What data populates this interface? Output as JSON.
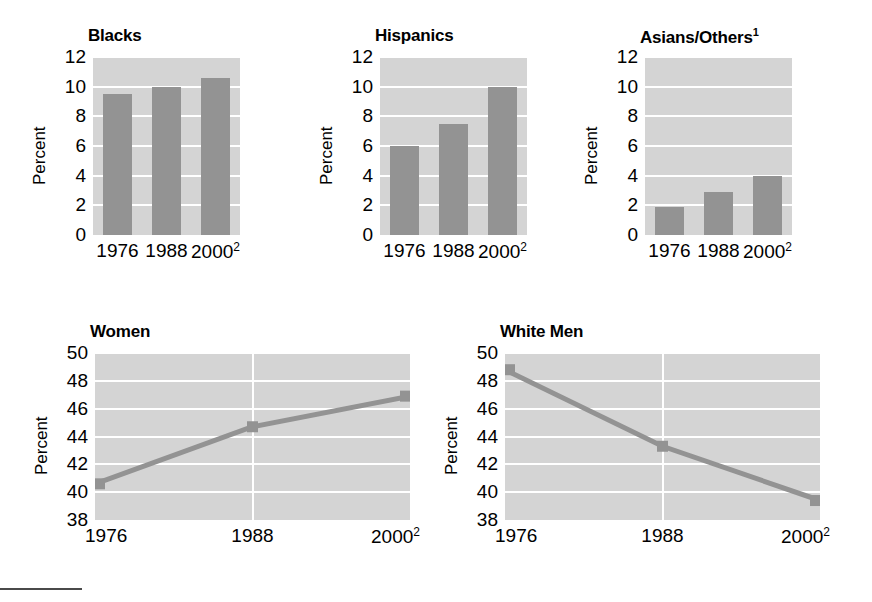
{
  "figure": {
    "footnote_rule": true
  },
  "chart_data": [
    {
      "id": "blacks",
      "type": "bar",
      "title": "Blacks",
      "title_superscript": "",
      "xlabel": "",
      "ylabel": "Percent",
      "categories": [
        "1976",
        "1988",
        "2000"
      ],
      "category_superscripts": [
        "",
        "",
        "2"
      ],
      "values": [
        9.5,
        10.0,
        10.6
      ],
      "ylim": [
        0,
        12
      ],
      "yticks": [
        0,
        2,
        4,
        6,
        8,
        10,
        12
      ],
      "grid": true,
      "legend": "none",
      "bar_color": "#939393",
      "plot_bg": "#d4d4d4"
    },
    {
      "id": "hispanics",
      "type": "bar",
      "title": "Hispanics",
      "title_superscript": "",
      "xlabel": "",
      "ylabel": "Percent",
      "categories": [
        "1976",
        "1988",
        "2000"
      ],
      "category_superscripts": [
        "",
        "",
        "2"
      ],
      "values": [
        6.0,
        7.5,
        10.0
      ],
      "ylim": [
        0,
        12
      ],
      "yticks": [
        0,
        2,
        4,
        6,
        8,
        10,
        12
      ],
      "grid": true,
      "legend": "none",
      "bar_color": "#939393",
      "plot_bg": "#d4d4d4"
    },
    {
      "id": "asians-others",
      "type": "bar",
      "title": "Asians/Others",
      "title_superscript": "1",
      "xlabel": "",
      "ylabel": "Percent",
      "categories": [
        "1976",
        "1988",
        "2000"
      ],
      "category_superscripts": [
        "",
        "",
        "2"
      ],
      "values": [
        1.9,
        2.9,
        4.0
      ],
      "ylim": [
        0,
        12
      ],
      "yticks": [
        0,
        2,
        4,
        6,
        8,
        10,
        12
      ],
      "grid": true,
      "legend": "none",
      "bar_color": "#939393",
      "plot_bg": "#d4d4d4"
    },
    {
      "id": "women",
      "type": "line",
      "title": "Women",
      "title_superscript": "",
      "xlabel": "",
      "ylabel": "Percent",
      "categories": [
        "1976",
        "1988",
        "2000"
      ],
      "category_superscripts": [
        "",
        "",
        "2"
      ],
      "values": [
        40.6,
        44.7,
        46.9
      ],
      "ylim": [
        38,
        50
      ],
      "yticks": [
        38,
        40,
        42,
        44,
        46,
        48,
        50
      ],
      "grid": true,
      "legend": "none",
      "line_color": "#939393",
      "plot_bg": "#d4d4d4"
    },
    {
      "id": "white-men",
      "type": "line",
      "title": "White Men",
      "title_superscript": "",
      "xlabel": "",
      "ylabel": "Percent",
      "categories": [
        "1976",
        "1988",
        "2000"
      ],
      "category_superscripts": [
        "",
        "",
        "2"
      ],
      "values": [
        48.8,
        43.3,
        39.4
      ],
      "ylim": [
        38,
        50
      ],
      "yticks": [
        38,
        40,
        42,
        44,
        46,
        48,
        50
      ],
      "grid": true,
      "legend": "none",
      "line_color": "#939393",
      "plot_bg": "#d4d4d4"
    }
  ]
}
